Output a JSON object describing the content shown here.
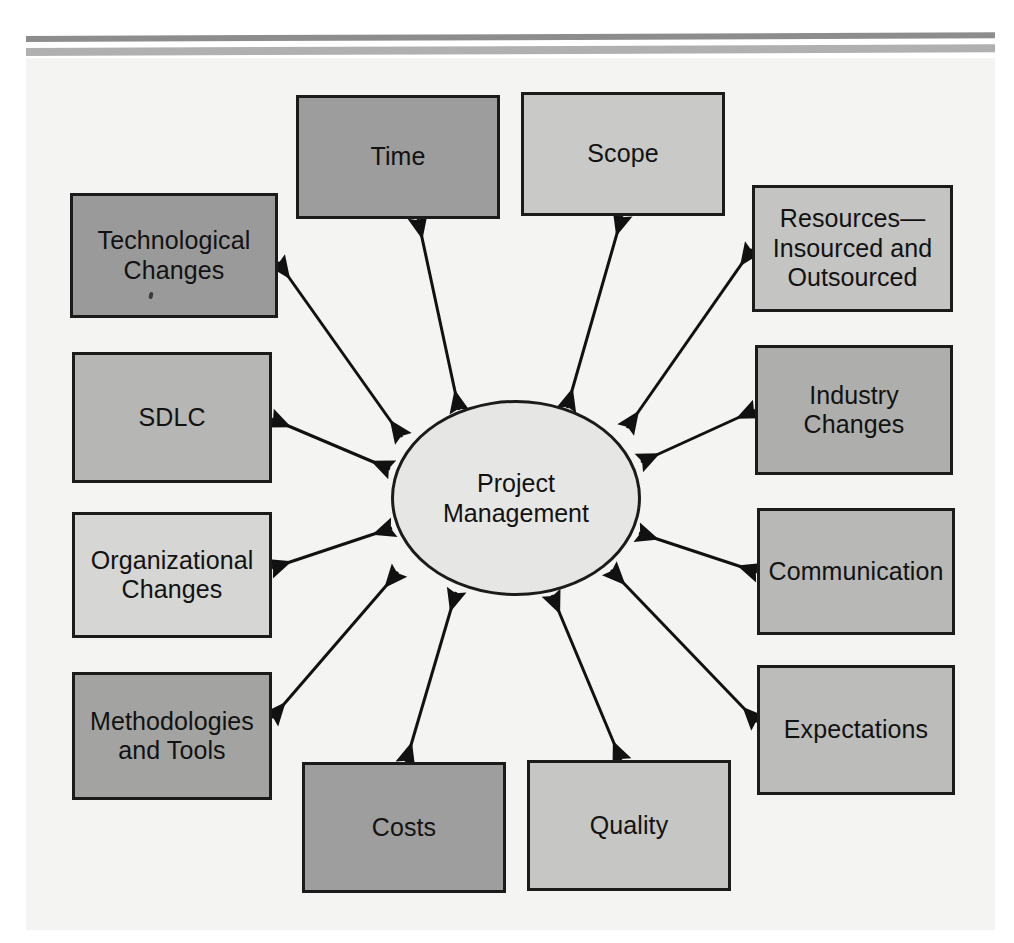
{
  "figure": {
    "center": {
      "label": "Project\nManagement",
      "fill": "#e6e6e4",
      "cx": 516,
      "cy": 498,
      "rx": 125,
      "ry": 98
    },
    "page_background": "#f4f4f2",
    "border_color": "#1b1b1b",
    "arrow_color": "#111111",
    "top_rules": [
      {
        "name": "rule-dark",
        "color": "#8d8d8d"
      },
      {
        "name": "rule-light",
        "color": "#b0b0b0"
      }
    ],
    "nodes": [
      {
        "id": "time",
        "label": "Time",
        "fill": "#9d9d9d",
        "x": 296,
        "y": 95,
        "w": 204,
        "h": 124,
        "anchor_x": 418,
        "anchor_y": 219,
        "tip_x": 459,
        "tip_y": 410
      },
      {
        "id": "scope",
        "label": "Scope",
        "fill": "#c9c9c7",
        "x": 521,
        "y": 92,
        "w": 204,
        "h": 124,
        "anchor_x": 622,
        "anchor_y": 216,
        "tip_x": 567,
        "tip_y": 408
      },
      {
        "id": "technological-changes",
        "label": "Technological\nChanges",
        "fill": "#9a9a9a",
        "x": 70,
        "y": 193,
        "w": 208,
        "h": 125,
        "anchor_x": 278,
        "anchor_y": 262,
        "tip_x": 402,
        "tip_y": 437
      },
      {
        "id": "resources",
        "label": "Resources—\nInsourced and\nOutsourced",
        "fill": "#c4c4c2",
        "x": 752,
        "y": 185,
        "w": 201,
        "h": 127,
        "anchor_x": 752,
        "anchor_y": 249,
        "tip_x": 627,
        "tip_y": 428
      },
      {
        "id": "sdlc",
        "label": "SDLC",
        "fill": "#b6b6b4",
        "x": 72,
        "y": 352,
        "w": 200,
        "h": 131,
        "anchor_x": 272,
        "anchor_y": 419,
        "tip_x": 390,
        "tip_y": 469
      },
      {
        "id": "industry-changes",
        "label": "Industry\nChanges",
        "fill": "#aeaeac",
        "x": 755,
        "y": 345,
        "w": 198,
        "h": 130,
        "anchor_x": 755,
        "anchor_y": 410,
        "tip_x": 641,
        "tip_y": 462
      },
      {
        "id": "organizational-changes",
        "label": "Organizational\nChanges",
        "fill": "#d6d6d4",
        "x": 72,
        "y": 512,
        "w": 200,
        "h": 126,
        "anchor_x": 272,
        "anchor_y": 568,
        "tip_x": 392,
        "tip_y": 528
      },
      {
        "id": "communication",
        "label": "Communication",
        "fill": "#b8b8b6",
        "x": 757,
        "y": 508,
        "w": 198,
        "h": 127,
        "anchor_x": 757,
        "anchor_y": 572,
        "tip_x": 639,
        "tip_y": 533
      },
      {
        "id": "methodologies-and-tools",
        "label": "Methodologies\nand Tools",
        "fill": "#a3a3a1",
        "x": 72,
        "y": 672,
        "w": 200,
        "h": 128,
        "anchor_x": 272,
        "anchor_y": 718,
        "tip_x": 398,
        "tip_y": 572
      },
      {
        "id": "expectations",
        "label": "Expectations",
        "fill": "#bcbcba",
        "x": 757,
        "y": 665,
        "w": 198,
        "h": 130,
        "anchor_x": 757,
        "anchor_y": 722,
        "tip_x": 611,
        "tip_y": 570
      },
      {
        "id": "costs",
        "label": "Costs",
        "fill": "#9e9e9e",
        "x": 302,
        "y": 762,
        "w": 204,
        "h": 131,
        "anchor_x": 406,
        "anchor_y": 762,
        "tip_x": 456,
        "tip_y": 592
      },
      {
        "id": "quality",
        "label": "Quality",
        "fill": "#c6c6c4",
        "x": 527,
        "y": 760,
        "w": 204,
        "h": 131,
        "anchor_x": 621,
        "anchor_y": 760,
        "tip_x": 552,
        "tip_y": 595
      }
    ]
  }
}
